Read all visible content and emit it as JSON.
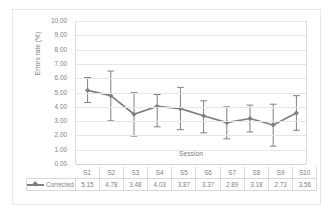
{
  "chart_data": {
    "type": "line",
    "title": "",
    "xlabel": "Session",
    "ylabel": "Errors rate (%)",
    "categories": [
      "S1",
      "S2",
      "S3",
      "S4",
      "S5",
      "S6",
      "S7",
      "S8",
      "S9",
      "S10"
    ],
    "series": [
      {
        "name": "Corrected",
        "values": [
          5.15,
          4.78,
          3.48,
          4.03,
          3.87,
          3.37,
          2.89,
          3.18,
          2.73,
          3.56
        ],
        "error_low": [
          4.3,
          3.02,
          1.95,
          2.6,
          2.4,
          2.18,
          1.76,
          2.24,
          1.25,
          2.36
        ],
        "error_high": [
          6.05,
          6.5,
          4.99,
          4.86,
          5.36,
          4.42,
          4.0,
          4.12,
          4.18,
          4.78
        ],
        "color": "#808080",
        "marker": "diamond"
      }
    ],
    "ylim": [
      0,
      10
    ],
    "ystep": 1,
    "ytick_labels": [
      "0.00",
      "1.00",
      "2.00",
      "3.00",
      "4.00",
      "5.00",
      "6.00",
      "7.00",
      "8.00",
      "9.00",
      "10.00"
    ],
    "grid": true,
    "legend_position": "data-table",
    "data_table": {
      "visible": true,
      "row_label": "Corrected",
      "columns": [
        "S1",
        "S2",
        "S3",
        "S4",
        "S5",
        "S6",
        "S7",
        "S8",
        "S9",
        "S10"
      ],
      "values": [
        "5.15",
        "4.78",
        "3.48",
        "4.03",
        "3.87",
        "3.37",
        "2.89",
        "3.18",
        "2.73",
        "3.56"
      ]
    }
  },
  "colors": {
    "series": "#808080",
    "gridline": "#e6e6e6",
    "axis": "#d9d9d9",
    "text": "#7f7f7f",
    "background": "#ffffff",
    "frame": "#e8e8e8"
  }
}
